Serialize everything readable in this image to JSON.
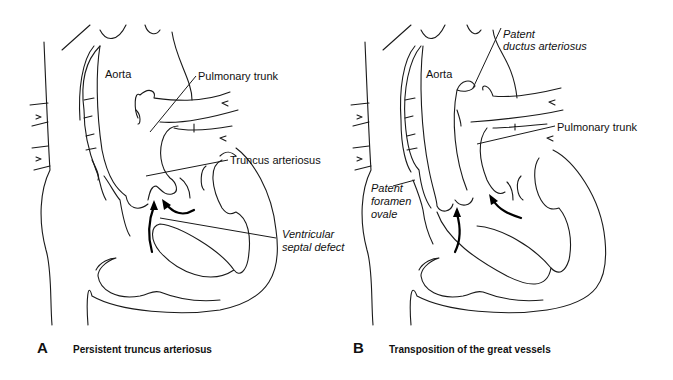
{
  "figure": {
    "panels": [
      {
        "letter": "A",
        "caption": "Persistent truncus arteriosus",
        "labels": {
          "aorta": "Aorta",
          "pulmonary_trunk": "Pulmonary trunk",
          "truncus_arteriosus": "Truncus arteriosus",
          "vsd_line1": "Ventricular",
          "vsd_line2": "septal defect"
        }
      },
      {
        "letter": "B",
        "caption": "Transposition of the great vessels",
        "labels": {
          "pda_line1": "Patent",
          "pda_line2": "ductus arteriosus",
          "aorta": "Aorta",
          "pulmonary_trunk": "Pulmonary trunk",
          "pfo_line1": "Patent",
          "pfo_line2": "foramen",
          "pfo_line3": "ovale"
        }
      }
    ],
    "colors": {
      "line": "#1a1a1a",
      "background": "#ffffff"
    }
  }
}
